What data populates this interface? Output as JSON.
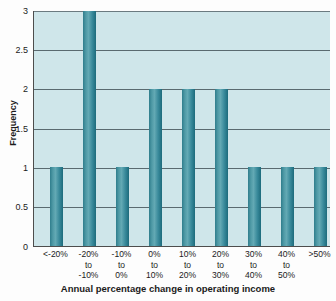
{
  "chart_data": {
    "type": "bar",
    "title": "",
    "subtitle": "",
    "xlabel": "Annual percentage change in operating income",
    "ylabel": "Frequency",
    "categories": [
      "<-20%",
      "-20% to -10%",
      "-10% to 0%",
      "0% to 10%",
      "10% to 20%",
      "20% to 30%",
      "30% to 40%",
      "40% to 50%",
      ">50%"
    ],
    "category_lines": [
      [
        "<-20%"
      ],
      [
        "-20%",
        "to",
        "-10%"
      ],
      [
        "-10%",
        "to",
        "0%"
      ],
      [
        "0%",
        "to",
        "10%"
      ],
      [
        "10%",
        "to",
        "20%"
      ],
      [
        "20%",
        "to",
        "30%"
      ],
      [
        "30%",
        "to",
        "40%"
      ],
      [
        "40%",
        "to",
        "50%"
      ],
      [
        ">50%"
      ]
    ],
    "values": [
      1,
      3,
      1,
      2,
      2,
      2,
      1,
      1,
      1
    ],
    "ylim": [
      0,
      3
    ],
    "yticks": [
      0,
      0.5,
      1,
      1.5,
      2,
      2.5,
      3
    ],
    "ytick_labels": [
      "0",
      "0.5",
      "1",
      "1.5",
      "2",
      "2.5",
      "3"
    ],
    "grid": true,
    "grid_axis": "y",
    "legend": "none",
    "bar_color": "#2f7d8c",
    "plot_background": "#cfe6ea",
    "axis_color": "#4d4d4d",
    "gridline_color": "#5a6a70",
    "page_background": "#fdfdfd"
  }
}
